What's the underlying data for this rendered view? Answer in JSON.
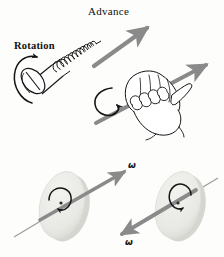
{
  "figure": {
    "title_hidden": "",
    "background_color": "#fdfdfc",
    "ink_color": "#151515",
    "arrow_color": "#8a8a8a",
    "arrow_color_dark": "#6f6f6f",
    "disk_face_color": "#e9e9e6",
    "disk_edge_color": "#cfcfca",
    "labels": {
      "advance": "Advance",
      "rotation": "Rotation",
      "omega_left": "ω",
      "omega_right": "ω"
    },
    "panels": [
      {
        "name": "screw-panel",
        "caption_labels": [
          "Advance",
          "Rotation"
        ],
        "description": "slotted-head screw with helical threads advancing along a straight gray arrow while a curved arrow shows rotation at the head"
      },
      {
        "name": "hand-panel",
        "caption_labels": [],
        "description": "right hand gripping a shaft, fingers curling in the rotation sense, thumb and arrow pointing up-right"
      },
      {
        "name": "disk-left-panel",
        "caption_labels": [
          "ω"
        ],
        "description": "tilted disk spinning with angular velocity vector pointing up-right along the rotation axis"
      },
      {
        "name": "disk-right-panel",
        "caption_labels": [
          "ω"
        ],
        "description": "tilted disk spinning oppositely with angular velocity vector pointing down-left along the rotation axis"
      }
    ]
  }
}
